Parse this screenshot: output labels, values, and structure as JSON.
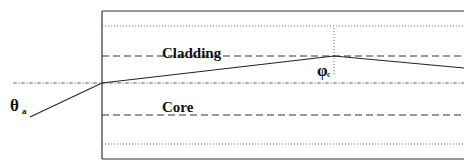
{
  "diagram": {
    "labels": {
      "cladding": "Cladding",
      "core": "Core",
      "acceptance_angle": "θ",
      "acceptance_angle_sub": "a",
      "critical_angle": "φ",
      "critical_angle_sub": "c"
    },
    "colors": {
      "line": "#222222",
      "background": "#ffffff"
    }
  }
}
